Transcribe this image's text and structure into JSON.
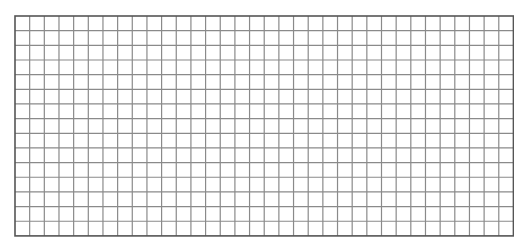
{
  "grid": {
    "rows": 15,
    "columns": 34,
    "cell_size": 14.66,
    "origin_x": 14,
    "origin_y": 15.5,
    "border_color": "#555555",
    "line_color": "#8a8a8a",
    "background": "#ffffff"
  }
}
